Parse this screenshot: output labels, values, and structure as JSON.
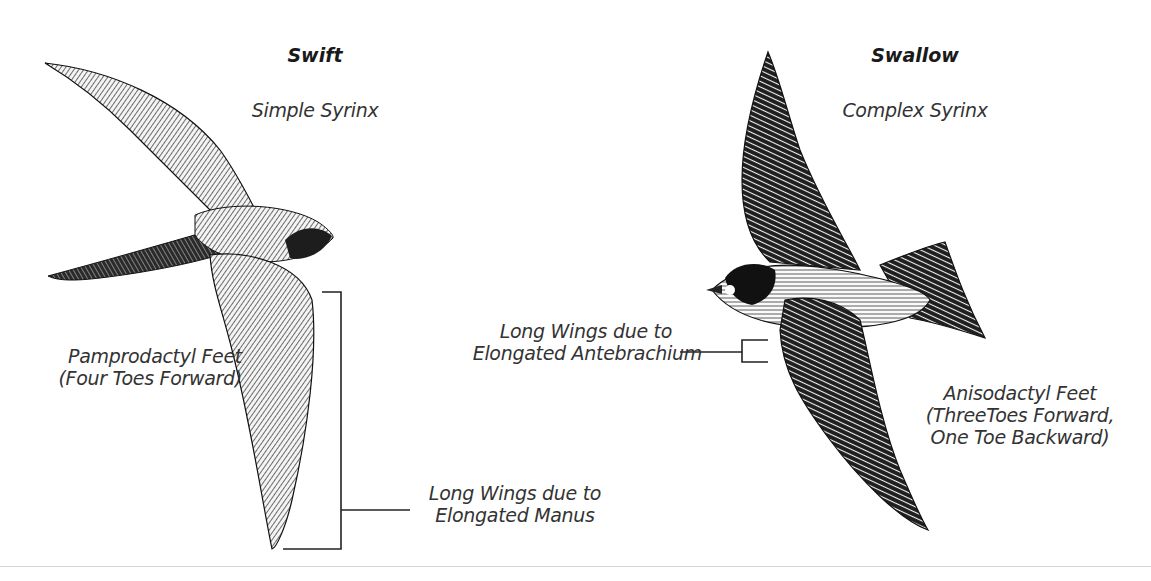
{
  "swift": {
    "title": "Swift",
    "syrinx": "Simple Syrinx",
    "feet": {
      "line1": "Pamprodactyl Feet",
      "line2": "(Four Toes Forward)"
    },
    "wings": {
      "line1": "Long Wings due to",
      "line2": "Elongated Manus"
    }
  },
  "swallow": {
    "title": "Swallow",
    "syrinx": "Complex Syrinx",
    "feet": {
      "line1": "Anisodactyl Feet",
      "line2": "(ThreeToes Forward,",
      "line3": "One Toe Backward)"
    },
    "wings": {
      "line1": "Long Wings due to",
      "line2": "Elongated Antebrachium"
    }
  },
  "colors": {
    "ink": "#1a1a1a",
    "text": "#333333",
    "divider": "#d6d6d6",
    "background": "#ffffff"
  }
}
